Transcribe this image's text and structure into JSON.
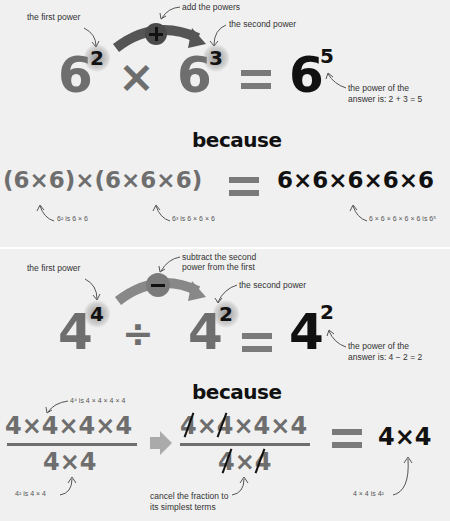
{
  "multiplication": {
    "note_first_power": "the first power",
    "note_add": "add the powers",
    "note_second_power": "the second power",
    "operator_symbol": "+",
    "base1": "6",
    "exp1": "2",
    "times": "×",
    "base2": "6",
    "exp2": "3",
    "result_base": "6",
    "result_exp": "5",
    "note_answer_line1": "the power of the",
    "note_answer_line2": "answer is: 2 + 3 = 5",
    "because": "because",
    "expanded_left": "(6×6)×(6×6×6)",
    "expanded_right": "6×6×6×6×6",
    "note_6sq": "6² is 6 × 6",
    "note_6cube": "6³ is 6 × 6 × 6",
    "note_6fifth": "6 × 6 × 6 × 6 × 6 is 6⁵"
  },
  "division": {
    "note_first_power": "the first power",
    "note_subtract_line1": "subtract the second",
    "note_subtract_line2": "power from the first",
    "note_second_power": "the second power",
    "operator_symbol": "−",
    "base1": "4",
    "exp1": "4",
    "divide": "÷",
    "base2": "4",
    "exp2": "2",
    "result_base": "4",
    "result_exp": "2",
    "note_answer_line1": "the power of the",
    "note_answer_line2": "answer is: 4 − 2 = 2",
    "because": "because",
    "numerator": "4×4×4×4",
    "denominator": "4×4",
    "cancel_numerator": "4×4×4×4",
    "cancel_denominator": "4×4",
    "result_expr": "4×4",
    "note_4fourth": "4⁴ is 4 × 4 × 4 × 4",
    "note_4sq": "4² is 4 × 4",
    "note_cancel_line1": "cancel the fraction to",
    "note_cancel_line2": "its simplest terms",
    "note_result": "4 × 4 is 4²"
  },
  "colors": {
    "background": "#f0f0f0",
    "gray_text": "#6e6e6e",
    "dark_text": "#111111",
    "arrow_gray": "#5a5a5a",
    "divider": "#ffffff"
  }
}
